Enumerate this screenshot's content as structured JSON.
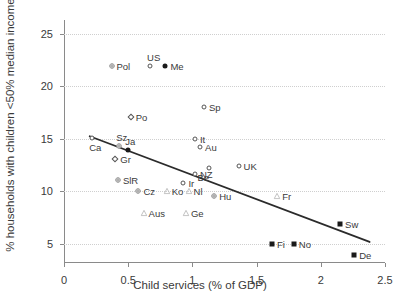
{
  "chart_data": {
    "type": "scatter",
    "title": "",
    "xlabel": "Child services (% of GDP)",
    "ylabel": "% households with children <50% median income",
    "xlim": [
      0,
      2.5
    ],
    "ylim": [
      3.2,
      26.3
    ],
    "xticks": [
      "0",
      "0.5",
      "1",
      "1.5",
      "2",
      "2.5"
    ],
    "xtick_values": [
      0,
      0.5,
      1,
      1.5,
      2,
      2.5
    ],
    "yticks": [
      "5",
      "10",
      "15",
      "20",
      "25"
    ],
    "ytick_values": [
      5,
      10,
      15,
      20,
      25
    ],
    "grid": "horizontal-dotted",
    "legend": "none",
    "trendline": {
      "description": "downward-sloping linear fit",
      "x_start": 0.2,
      "y_start": 15.25,
      "x_end": 2.38,
      "y_end": 5.2
    },
    "points": [
      {
        "label": "Pol",
        "x": 0.37,
        "y": 21.9,
        "marker": "gray-spoke",
        "label_pos": "right"
      },
      {
        "label": "US",
        "x": 0.67,
        "y": 21.9,
        "marker": "open-circle",
        "label_pos": "above"
      },
      {
        "label": "Me",
        "x": 0.79,
        "y": 21.9,
        "marker": "filled-circle",
        "label_pos": "right"
      },
      {
        "label": "Sp",
        "x": 1.09,
        "y": 18.0,
        "marker": "open-circle",
        "label_pos": "right"
      },
      {
        "label": "Po",
        "x": 0.52,
        "y": 17.1,
        "marker": "open-diamond",
        "label_pos": "right"
      },
      {
        "label": "Ca",
        "x": 0.22,
        "y": 15.1,
        "marker": "open-circle",
        "label_pos": "below"
      },
      {
        "label": "It",
        "x": 1.02,
        "y": 15.0,
        "marker": "open-circle",
        "label_pos": "right"
      },
      {
        "label": "Au",
        "x": 1.06,
        "y": 14.2,
        "marker": "open-circle",
        "label_pos": "right"
      },
      {
        "label": "Sz",
        "x": 0.43,
        "y": 14.3,
        "marker": "gray-spoke",
        "label_pos": "above"
      },
      {
        "label": "Ja",
        "x": 0.5,
        "y": 13.9,
        "marker": "filled-circle",
        "label_pos": "above"
      },
      {
        "label": "Gr",
        "x": 0.4,
        "y": 13.1,
        "marker": "open-diamond",
        "label_pos": "right"
      },
      {
        "label": "Be",
        "x": 1.13,
        "y": 12.2,
        "marker": "open-circle",
        "label_pos": "belowleft"
      },
      {
        "label": "NZ",
        "x": 1.02,
        "y": 11.7,
        "marker": "open-circle",
        "label_pos": "right"
      },
      {
        "label": "UK",
        "x": 1.36,
        "y": 12.4,
        "marker": "open-circle",
        "label_pos": "right"
      },
      {
        "label": "SlR",
        "x": 0.42,
        "y": 11.1,
        "marker": "gray-spoke",
        "label_pos": "right"
      },
      {
        "label": "Ir",
        "x": 0.93,
        "y": 10.8,
        "marker": "open-circle",
        "label_pos": "right"
      },
      {
        "label": "Cz",
        "x": 0.58,
        "y": 10.0,
        "marker": "gray-spoke",
        "label_pos": "right"
      },
      {
        "label": "Ko",
        "x": 0.8,
        "y": 10.0,
        "marker": "open-triangle",
        "label_pos": "right"
      },
      {
        "label": "Nl",
        "x": 0.97,
        "y": 10.0,
        "marker": "open-triangle",
        "label_pos": "right"
      },
      {
        "label": "Hu",
        "x": 1.17,
        "y": 9.6,
        "marker": "gray-spoke",
        "label_pos": "right"
      },
      {
        "label": "Aus",
        "x": 0.62,
        "y": 8.0,
        "marker": "open-triangle",
        "label_pos": "right"
      },
      {
        "label": "Ge",
        "x": 0.95,
        "y": 8.0,
        "marker": "open-triangle",
        "label_pos": "right"
      },
      {
        "label": "Fr",
        "x": 1.66,
        "y": 9.6,
        "marker": "open-triangle",
        "label_pos": "right"
      },
      {
        "label": "Sw",
        "x": 2.15,
        "y": 6.9,
        "marker": "filled-square",
        "label_pos": "right"
      },
      {
        "label": "Fi",
        "x": 1.62,
        "y": 5.0,
        "marker": "filled-square",
        "label_pos": "right"
      },
      {
        "label": "No",
        "x": 1.79,
        "y": 5.0,
        "marker": "filled-square",
        "label_pos": "right"
      },
      {
        "label": "De",
        "x": 2.26,
        "y": 4.0,
        "marker": "filled-square",
        "label_pos": "right"
      }
    ]
  },
  "colors": {
    "axis": "#8a8a8a",
    "grid": "#cfcfcf",
    "text": "#3a3a3a",
    "trendline": "#2b2b2b",
    "marker_dark": "#1a1a1a",
    "marker_outline": "#555555",
    "marker_gray": "#8d8d8d",
    "marker_light": "#b9b9b9",
    "background": "#ffffff"
  }
}
